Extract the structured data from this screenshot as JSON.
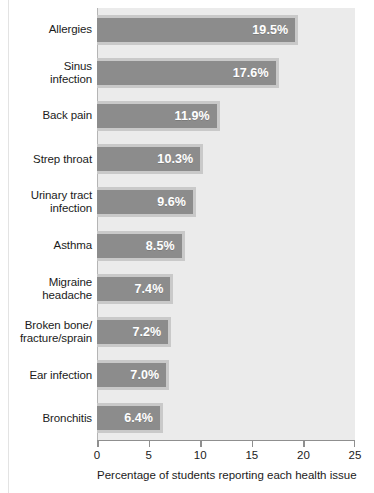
{
  "chart_data": {
    "type": "bar",
    "orientation": "horizontal",
    "title": "",
    "subtitle": "",
    "xlabel": "Percentage of students reporting each health issue",
    "ylabel": "",
    "xlim": [
      0,
      25
    ],
    "xticks": [
      0,
      5,
      10,
      15,
      20,
      25
    ],
    "xtick_labels": [
      "0",
      "5",
      "10",
      "15",
      "20",
      "25"
    ],
    "grid": false,
    "legend": null,
    "categories": [
      "Allergies",
      "Sinus infection",
      "Back pain",
      "Strep throat",
      "Urinary tract infection",
      "Asthma",
      "Migraine headache",
      "Broken bone/ fracture/sprain",
      "Ear infection",
      "Bronchitis"
    ],
    "values": [
      19.5,
      17.6,
      11.9,
      10.3,
      9.6,
      8.5,
      7.4,
      7.2,
      7.0,
      6.4
    ],
    "data_labels": [
      "19.5%",
      "17.6%",
      "11.9%",
      "10.3%",
      "9.6%",
      "8.5%",
      "7.4%",
      "7.2%",
      "7.0%",
      "6.4%"
    ],
    "colors": {
      "bar_fill": "#8c8c8c",
      "bar_border": "#c9c9c9",
      "plot_background": "#ebebeb",
      "axis": "#8f8f8f",
      "text": "#1b1b1b",
      "label_text": "#ffffff"
    }
  },
  "categories_display": [
    {
      "lines": [
        "Allergies"
      ]
    },
    {
      "lines": [
        "Sinus",
        "infection"
      ]
    },
    {
      "lines": [
        "Back pain"
      ]
    },
    {
      "lines": [
        "Strep throat"
      ]
    },
    {
      "lines": [
        "Urinary tract",
        "infection"
      ]
    },
    {
      "lines": [
        "Asthma"
      ]
    },
    {
      "lines": [
        "Migraine",
        "headache"
      ]
    },
    {
      "lines": [
        "Broken bone/",
        "fracture/sprain"
      ]
    },
    {
      "lines": [
        "Ear infection"
      ]
    },
    {
      "lines": [
        "Bronchitis"
      ]
    }
  ]
}
